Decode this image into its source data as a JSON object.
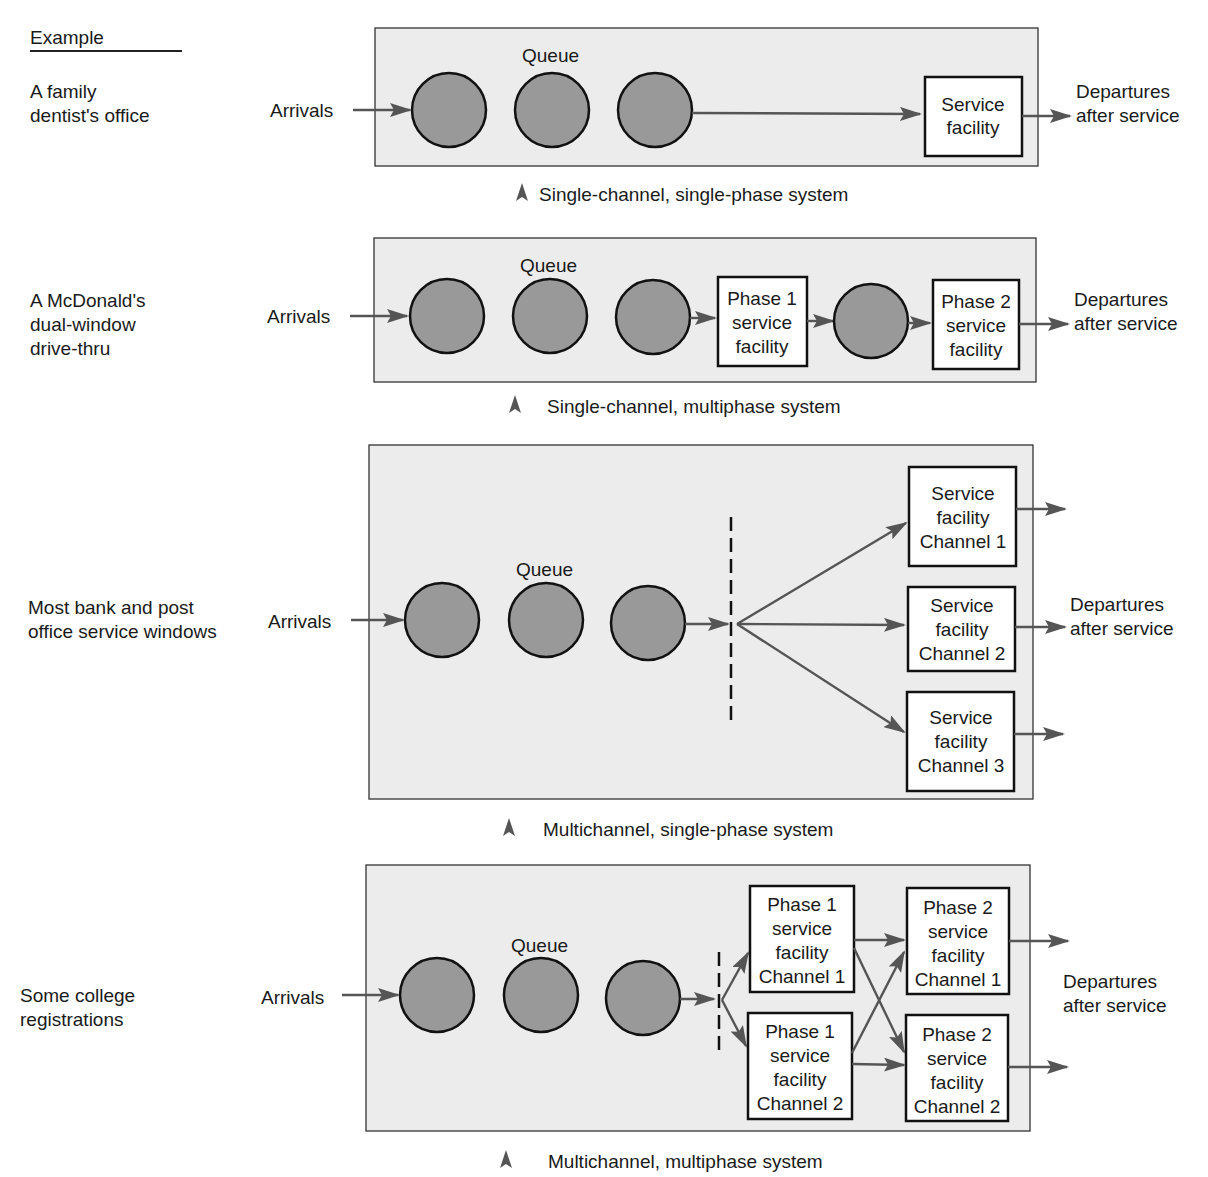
{
  "header": {
    "example_label": "Example"
  },
  "common": {
    "arrivals": "Arrivals",
    "queue": "Queue",
    "departures_line1": "Departures",
    "departures_line2": "after service"
  },
  "colors": {
    "panel": "#ececec",
    "circle": "#999999",
    "arrow": "#555555",
    "stroke": "#111111"
  },
  "systems": [
    {
      "example": [
        "A family",
        "dentist's office"
      ],
      "caption": "Single-channel, single-phase system",
      "facilities": [
        [
          "Service",
          "facility"
        ]
      ]
    },
    {
      "example": [
        "A McDonald's",
        "dual-window",
        "drive-thru"
      ],
      "caption": "Single-channel, multiphase system",
      "facilities": [
        [
          "Phase 1",
          "service",
          "facility"
        ],
        [
          "Phase 2",
          "service",
          "facility"
        ]
      ]
    },
    {
      "example": [
        "Most bank and post",
        "office service windows"
      ],
      "caption": "Multichannel, single-phase system",
      "facilities": [
        [
          "Service",
          "facility",
          "Channel 1"
        ],
        [
          "Service",
          "facility",
          "Channel 2"
        ],
        [
          "Service",
          "facility",
          "Channel 3"
        ]
      ]
    },
    {
      "example": [
        "Some college",
        "registrations"
      ],
      "caption": "Multichannel, multiphase system",
      "facilities": [
        [
          "Phase 1",
          "service",
          "facility",
          "Channel 1"
        ],
        [
          "Phase 1",
          "service",
          "facility",
          "Channel 2"
        ],
        [
          "Phase 2",
          "service",
          "facility",
          "Channel 1"
        ],
        [
          "Phase 2",
          "service",
          "facility",
          "Channel 2"
        ]
      ]
    }
  ]
}
